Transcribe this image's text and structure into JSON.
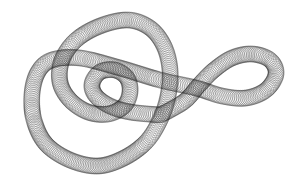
{
  "image": {
    "subject": "spirograph coil knot",
    "background": "#ffffff",
    "stroke_color": "#1a1a1a",
    "tube_radius": 8,
    "circle_spacing": 1.6
  },
  "path_points": [
    [
      160,
      115
    ],
    [
      130,
      112
    ],
    [
      110,
      106
    ],
    [
      96,
      96
    ],
    [
      92,
      84
    ],
    [
      100,
      72
    ],
    [
      115,
      70
    ],
    [
      127,
      78
    ],
    [
      130,
      92
    ],
    [
      124,
      106
    ],
    [
      108,
      114
    ],
    [
      88,
      112
    ],
    [
      70,
      100
    ],
    [
      60,
      82
    ],
    [
      62,
      60
    ],
    [
      76,
      40
    ],
    [
      100,
      26
    ],
    [
      128,
      20
    ],
    [
      150,
      28
    ],
    [
      164,
      46
    ],
    [
      170,
      70
    ],
    [
      168,
      96
    ],
    [
      160,
      120
    ],
    [
      146,
      142
    ],
    [
      124,
      158
    ],
    [
      98,
      166
    ],
    [
      70,
      160
    ],
    [
      46,
      144
    ],
    [
      34,
      120
    ],
    [
      32,
      94
    ],
    [
      38,
      72
    ],
    [
      52,
      60
    ],
    [
      80,
      58
    ],
    [
      120,
      68
    ],
    [
      160,
      80
    ],
    [
      196,
      88
    ],
    [
      222,
      96
    ],
    [
      246,
      98
    ],
    [
      266,
      90
    ],
    [
      276,
      74
    ],
    [
      270,
      60
    ],
    [
      252,
      54
    ],
    [
      232,
      58
    ],
    [
      214,
      70
    ],
    [
      200,
      84
    ],
    [
      186,
      100
    ],
    [
      170,
      110
    ],
    [
      160,
      115
    ]
  ]
}
